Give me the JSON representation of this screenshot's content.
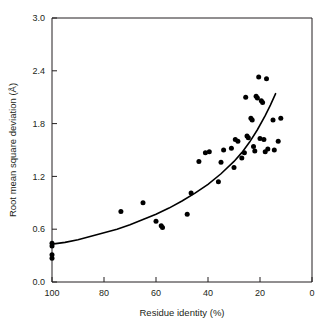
{
  "chart_data": {
    "type": "scatter",
    "title": "",
    "subtitle": "",
    "xlabel": "Residue identity (%)",
    "ylabel": "Root mean square deviation (Å)",
    "xlim": [
      100,
      0
    ],
    "ylim": [
      0.0,
      3.0
    ],
    "x_axis_reversed": true,
    "grid": false,
    "legend": null,
    "legend_position": "none",
    "xticks": [
      100,
      80,
      60,
      40,
      20,
      0
    ],
    "xtick_labels": [
      "100",
      "80",
      "60",
      "40",
      "20",
      "0"
    ],
    "yticks": [
      0.0,
      0.6,
      1.2,
      1.8,
      2.4,
      3.0
    ],
    "ytick_labels": [
      "0.0",
      "0.6",
      "1.2",
      "1.8",
      "2.4",
      "3.0"
    ],
    "marker": "filled-circle",
    "marker_color": "#000000",
    "point_count": 44,
    "points": [
      {
        "x": 100.0,
        "y": 0.44
      },
      {
        "x": 100.0,
        "y": 0.41
      },
      {
        "x": 100.0,
        "y": 0.31
      },
      {
        "x": 100.0,
        "y": 0.27
      },
      {
        "x": 73.5,
        "y": 0.8
      },
      {
        "x": 65.0,
        "y": 0.9
      },
      {
        "x": 60.0,
        "y": 0.69
      },
      {
        "x": 58.0,
        "y": 0.64
      },
      {
        "x": 57.5,
        "y": 0.62
      },
      {
        "x": 48.0,
        "y": 0.77
      },
      {
        "x": 46.5,
        "y": 1.01
      },
      {
        "x": 43.5,
        "y": 1.37
      },
      {
        "x": 41.0,
        "y": 1.47
      },
      {
        "x": 39.5,
        "y": 1.48
      },
      {
        "x": 36.0,
        "y": 1.14
      },
      {
        "x": 35.0,
        "y": 1.36
      },
      {
        "x": 34.0,
        "y": 1.5
      },
      {
        "x": 30.0,
        "y": 1.3
      },
      {
        "x": 29.5,
        "y": 1.62
      },
      {
        "x": 28.5,
        "y": 1.6
      },
      {
        "x": 27.0,
        "y": 1.41
      },
      {
        "x": 26.0,
        "y": 1.47
      },
      {
        "x": 25.5,
        "y": 2.1
      },
      {
        "x": 25.0,
        "y": 1.66
      },
      {
        "x": 24.5,
        "y": 1.64
      },
      {
        "x": 23.5,
        "y": 1.86
      },
      {
        "x": 23.0,
        "y": 1.84
      },
      {
        "x": 22.5,
        "y": 1.54
      },
      {
        "x": 22.0,
        "y": 1.49
      },
      {
        "x": 21.5,
        "y": 2.11
      },
      {
        "x": 21.0,
        "y": 2.09
      },
      {
        "x": 20.5,
        "y": 2.33
      },
      {
        "x": 20.0,
        "y": 1.63
      },
      {
        "x": 19.5,
        "y": 2.06
      },
      {
        "x": 19.0,
        "y": 2.04
      },
      {
        "x": 18.5,
        "y": 1.62
      },
      {
        "x": 18.0,
        "y": 1.48
      },
      {
        "x": 17.5,
        "y": 2.31
      },
      {
        "x": 17.0,
        "y": 1.51
      },
      {
        "x": 15.0,
        "y": 1.84
      },
      {
        "x": 14.5,
        "y": 1.5
      },
      {
        "x": 13.0,
        "y": 1.6
      },
      {
        "x": 12.0,
        "y": 1.86
      },
      {
        "x": 31.0,
        "y": 1.52
      }
    ],
    "fit_curve": {
      "label": "exponential fit",
      "color": "#000000",
      "x_start": 100,
      "x_end": 14,
      "points": [
        {
          "x": 100,
          "y": 0.43
        },
        {
          "x": 95,
          "y": 0.45
        },
        {
          "x": 90,
          "y": 0.48
        },
        {
          "x": 85,
          "y": 0.52
        },
        {
          "x": 80,
          "y": 0.56
        },
        {
          "x": 75,
          "y": 0.6
        },
        {
          "x": 70,
          "y": 0.65
        },
        {
          "x": 65,
          "y": 0.71
        },
        {
          "x": 60,
          "y": 0.77
        },
        {
          "x": 55,
          "y": 0.84
        },
        {
          "x": 50,
          "y": 0.92
        },
        {
          "x": 45,
          "y": 1.01
        },
        {
          "x": 40,
          "y": 1.11
        },
        {
          "x": 35,
          "y": 1.23
        },
        {
          "x": 30,
          "y": 1.37
        },
        {
          "x": 27,
          "y": 1.47
        },
        {
          "x": 24,
          "y": 1.59
        },
        {
          "x": 21,
          "y": 1.73
        },
        {
          "x": 18,
          "y": 1.89
        },
        {
          "x": 16,
          "y": 2.01
        },
        {
          "x": 14,
          "y": 2.14
        }
      ]
    }
  }
}
